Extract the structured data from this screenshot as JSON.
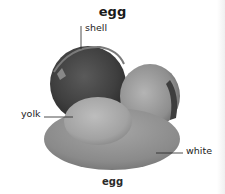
{
  "title": "egg",
  "caption": "egg",
  "labels": {
    "shell": "shell",
    "yolk": "yolk",
    "white": "white"
  },
  "colors": {
    "background": "#ffffff",
    "shell_dark": "#4a4a4a",
    "shell_light": "#9a9a9a",
    "yolk": "#a8a8a8",
    "white": "#8c8c8c",
    "text": "#222222"
  }
}
